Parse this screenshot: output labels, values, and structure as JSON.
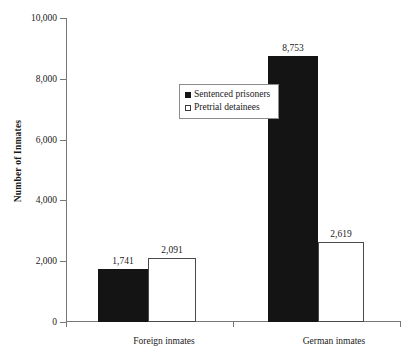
{
  "chart_data": {
    "type": "bar",
    "title": "",
    "subtitle": "",
    "xlabel": "",
    "ylabel": "Number of Inmates",
    "categories": [
      "Foreign inmates",
      "German inmates"
    ],
    "series": [
      {
        "name": "Sentenced prisoners",
        "values": [
          1741,
          8753
        ],
        "value_labels": [
          "1,741",
          "8,753"
        ],
        "color": "#141414",
        "swatch": "filled"
      },
      {
        "name": "Pretrial detainees",
        "values": [
          2091,
          2619
        ],
        "value_labels": [
          "2,091",
          "2,619"
        ],
        "color": "#ffffff",
        "swatch": "open"
      }
    ],
    "ylim": [
      0,
      10000
    ],
    "ytick_values": [
      0,
      2000,
      4000,
      6000,
      8000,
      10000
    ],
    "ytick_labels": [
      "0",
      "2,000",
      "4,000",
      "6,000",
      "8,000",
      "10,000"
    ],
    "grid": false,
    "legend_position": "upper-left-inside"
  },
  "legend": {
    "entries": [
      {
        "label": "Sentenced prisoners"
      },
      {
        "label": "Pretrial detainees"
      }
    ]
  },
  "axes": {
    "y_title": "Number of Inmates"
  }
}
